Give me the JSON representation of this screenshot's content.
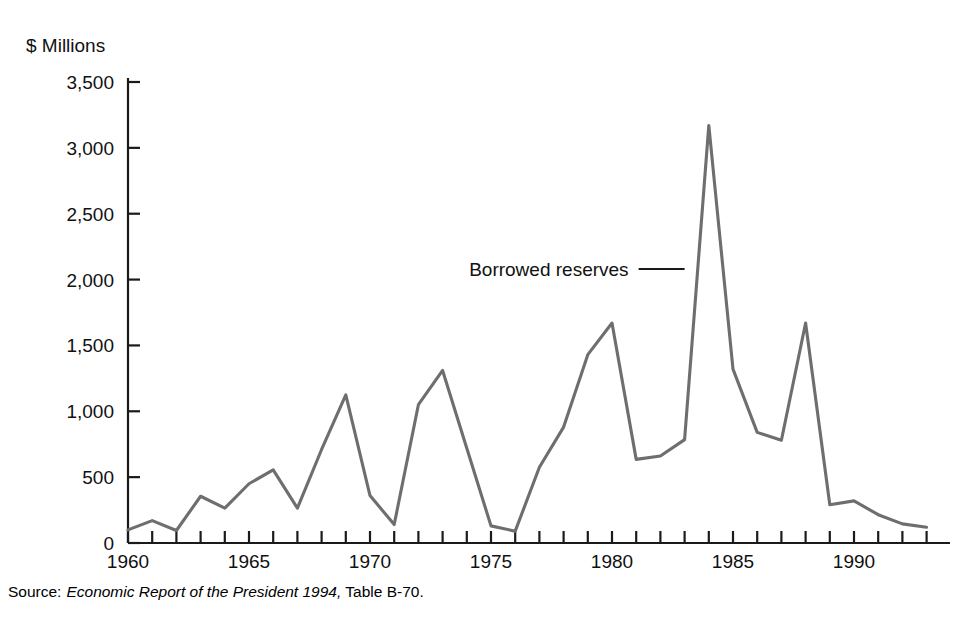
{
  "chart_data": {
    "type": "line",
    "title": "",
    "subtitle": "",
    "xlabel": "",
    "ylabel": "$ Millions",
    "ylim": [
      0,
      3500
    ],
    "xlim": [
      1960,
      1993
    ],
    "grid": false,
    "legend_position": "inline-annotation",
    "y_ticks": [
      "0",
      "500",
      "1,000",
      "1,500",
      "2,000",
      "2,500",
      "3,000",
      "3,500"
    ],
    "y_tick_values": [
      0,
      500,
      1000,
      1500,
      2000,
      2500,
      3000,
      3500
    ],
    "x_ticks": [
      "1960",
      "1965",
      "1970",
      "1975",
      "1980",
      "1985",
      "1990"
    ],
    "x_tick_values": [
      1960,
      1965,
      1970,
      1975,
      1980,
      1985,
      1990
    ],
    "x_minor_tick_step": 1,
    "annotations": [
      {
        "text": "Borrowed reserves",
        "points_to_year": 1983,
        "points_to_value": 2080
      }
    ],
    "series": [
      {
        "name": "Borrowed reserves",
        "color": "#6e6e6e",
        "x": [
          1960,
          1961,
          1962,
          1963,
          1964,
          1965,
          1966,
          1967,
          1968,
          1969,
          1970,
          1971,
          1972,
          1973,
          1974,
          1975,
          1976,
          1977,
          1978,
          1979,
          1980,
          1981,
          1982,
          1983,
          1984,
          1985,
          1986,
          1987,
          1988,
          1989,
          1990,
          1991,
          1992,
          1993
        ],
        "values": [
          100,
          170,
          95,
          355,
          265,
          450,
          555,
          265,
          710,
          1125,
          360,
          140,
          1050,
          1310,
          720,
          130,
          90,
          575,
          880,
          1430,
          1670,
          635,
          660,
          785,
          3170,
          1320,
          840,
          780,
          1670,
          290,
          320,
          215,
          145,
          120
        ]
      }
    ]
  },
  "source": {
    "label": "Source:",
    "title": "Economic Report of the President 1994,",
    "table": "Table B-70."
  }
}
